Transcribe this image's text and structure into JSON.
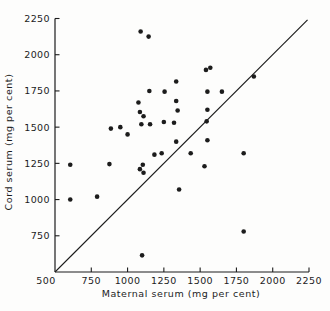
{
  "colors": {
    "ink": "#1c1c1c",
    "background": "#fdfdfc"
  },
  "chart_data": {
    "type": "scatter",
    "title": "",
    "xlabel": "Maternal serum (mg per cent)",
    "ylabel": "Cord serum (mg per cent)",
    "xlim": [
      500,
      2250
    ],
    "ylim": [
      500,
      2250
    ],
    "xticks": [
      750,
      1000,
      1250,
      1500,
      1750,
      2000,
      2250
    ],
    "yticks": [
      750,
      1000,
      1250,
      1500,
      1750,
      2000,
      2250
    ],
    "corner_tick_label": "500",
    "grid": false,
    "legend": null,
    "identity_line": {
      "x1": 500,
      "y1": 500,
      "x2": 2240,
      "y2": 2240
    },
    "points": [
      [
        1090,
        2160
      ],
      [
        1145,
        2125
      ],
      [
        1540,
        1895
      ],
      [
        1570,
        1910
      ],
      [
        1870,
        1850
      ],
      [
        1335,
        1815
      ],
      [
        1150,
        1750
      ],
      [
        1255,
        1745
      ],
      [
        1550,
        1745
      ],
      [
        1650,
        1745
      ],
      [
        1075,
        1670
      ],
      [
        1335,
        1680
      ],
      [
        1345,
        1615
      ],
      [
        1085,
        1605
      ],
      [
        1550,
        1620
      ],
      [
        1110,
        1575
      ],
      [
        1095,
        1520
      ],
      [
        1155,
        1520
      ],
      [
        1250,
        1535
      ],
      [
        1320,
        1530
      ],
      [
        1545,
        1540
      ],
      [
        885,
        1490
      ],
      [
        950,
        1500
      ],
      [
        1000,
        1450
      ],
      [
        1335,
        1400
      ],
      [
        1550,
        1410
      ],
      [
        1435,
        1320
      ],
      [
        1800,
        1320
      ],
      [
        1185,
        1310
      ],
      [
        1235,
        1320
      ],
      [
        605,
        1240
      ],
      [
        875,
        1245
      ],
      [
        1105,
        1240
      ],
      [
        1530,
        1230
      ],
      [
        1085,
        1210
      ],
      [
        1110,
        1185
      ],
      [
        1355,
        1070
      ],
      [
        605,
        1000
      ],
      [
        790,
        1020
      ],
      [
        1800,
        780
      ],
      [
        1100,
        615
      ]
    ],
    "point_radius_px": 2.3,
    "layout": {
      "note": "identity line y=x over scatter; ticks point inward; no grid; no legend"
    }
  }
}
